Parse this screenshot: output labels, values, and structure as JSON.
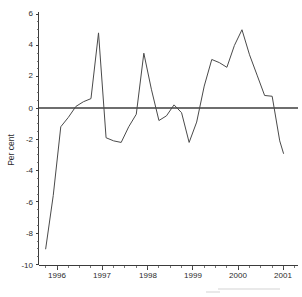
{
  "chart_data": {
    "type": "line",
    "title": "",
    "subtitle": "",
    "xlabel": "",
    "ylabel": "Per cent",
    "ylim": [
      -10,
      6
    ],
    "xlim": [
      "1995-10",
      "2001-01"
    ],
    "ytick_labels": [
      "6",
      "4",
      "2",
      "0",
      "-2",
      "-4",
      "-6",
      "-8",
      "-10"
    ],
    "ytick_values": [
      6,
      4,
      2,
      0,
      -2,
      -4,
      -6,
      -8,
      -10
    ],
    "xtick_labels": [
      "1996",
      "1997",
      "1998",
      "1999",
      "2000",
      "2001"
    ],
    "xtick_values": [
      1996,
      1997,
      1998,
      1999,
      2000,
      2001
    ],
    "x_minor_tick_interval_months": 3,
    "grid": false,
    "legend": null,
    "legend_position": "none",
    "annotations": [],
    "zero_reference_line": 0,
    "series": [
      {
        "name": "Per cent change",
        "x": [
          "1995-10",
          "1995-12",
          "1996-02",
          "1996-04",
          "1996-06",
          "1996-08",
          "1996-10",
          "1996-12",
          "1997-02",
          "1997-04",
          "1997-06",
          "1997-08",
          "1997-10",
          "1997-12",
          "1998-02",
          "1998-04",
          "1998-06",
          "1998-08",
          "1998-10",
          "1998-12",
          "1999-02",
          "1999-04",
          "1999-06",
          "1999-08",
          "1999-10",
          "1999-12",
          "2000-02",
          "2000-04",
          "2000-06",
          "2000-08",
          "2000-10",
          "2000-12",
          "2001-01"
        ],
        "values": [
          -9.0,
          -5.6,
          -1.2,
          -0.6,
          0.1,
          0.4,
          0.6,
          4.8,
          -1.9,
          -2.1,
          -2.2,
          -1.2,
          -0.4,
          3.5,
          1.2,
          -0.8,
          -0.5,
          0.2,
          -0.3,
          -2.2,
          -0.9,
          1.4,
          3.1,
          2.9,
          2.6,
          4.0,
          5.0,
          3.4,
          2.1,
          0.8,
          0.75,
          -2.1,
          -2.9
        ]
      }
    ]
  },
  "axis": {
    "y_label": "Per cent"
  }
}
